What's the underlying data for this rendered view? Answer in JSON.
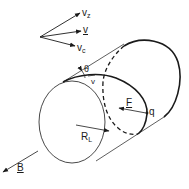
{
  "figure": {
    "type": "diagram",
    "colors": {
      "ink": "#1a1a1a",
      "background": "#ffffff"
    }
  },
  "velocity_vectors": {
    "vz": {
      "main": "v",
      "sub": "z"
    },
    "v": {
      "main": "v",
      "underlined": true
    },
    "vc": {
      "main": "v",
      "sub": "c"
    }
  },
  "labels": {
    "theta": "θ",
    "v_small": "v",
    "force": "F",
    "charge": "q",
    "radius": {
      "main": "R",
      "sub": "L"
    },
    "field": "B"
  }
}
